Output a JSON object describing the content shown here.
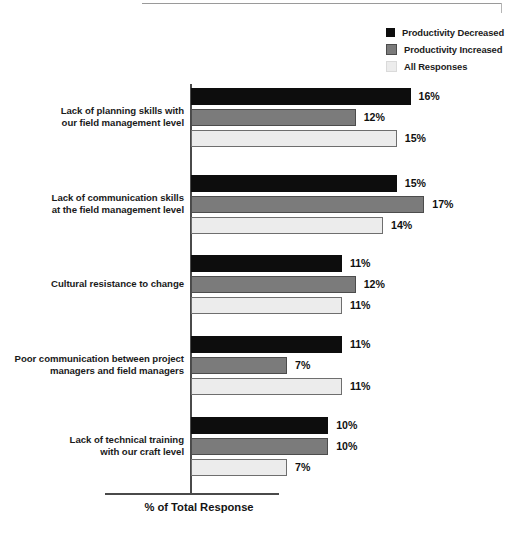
{
  "chart_data": {
    "type": "bar",
    "orientation": "horizontal",
    "title": "",
    "subtitle": "",
    "xlabel": "% of Total Response",
    "ylabel": "",
    "xlim": [
      0,
      18
    ],
    "grid": false,
    "legend_position": "top-right",
    "value_suffix": "%",
    "categories": [
      "Lack of planning skills with our field management level",
      "Lack of communication skills at the field management level",
      "Cultural resistance to change",
      "Poor communication between project managers and field managers",
      "Lack of technical training with our craft level"
    ],
    "category_lines": [
      [
        "Lack of planning skills with",
        "our field management level"
      ],
      [
        "Lack of communication skills",
        "at the field management level"
      ],
      [
        "Cultural resistance to change"
      ],
      [
        "Poor communication between project",
        "managers and field managers"
      ],
      [
        "Lack of technical training",
        "with our craft level"
      ]
    ],
    "series": [
      {
        "name": "Productivity Decreased",
        "color": "#0d0d0d",
        "values": [
          16,
          15,
          11,
          11,
          10
        ],
        "labels": [
          "16%",
          "15%",
          "11%",
          "11%",
          "10%"
        ]
      },
      {
        "name": "Productivity Increased",
        "color": "#7b7b7b",
        "values": [
          12,
          17,
          12,
          7,
          10
        ],
        "labels": [
          "12%",
          "17%",
          "12%",
          "7%",
          "10%"
        ]
      },
      {
        "name": "All Responses",
        "color": "#ececec",
        "values": [
          15,
          14,
          11,
          11,
          7
        ],
        "labels": [
          "15%",
          "14%",
          "11%",
          "11%",
          "7%"
        ]
      }
    ]
  },
  "legend": {
    "items": [
      {
        "label": "Productivity Decreased",
        "color": "#0d0d0d"
      },
      {
        "label": "Productivity Increased",
        "color": "#7b7b7b"
      },
      {
        "label": "All Responses",
        "color": "#ececec"
      }
    ]
  },
  "axis": {
    "x_title": "% of Total Response"
  }
}
